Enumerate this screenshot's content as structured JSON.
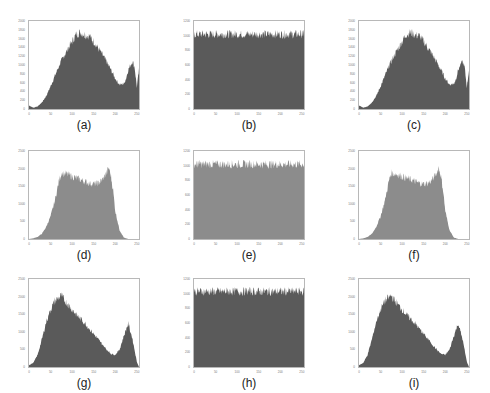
{
  "chart_data": [
    {
      "id": "a",
      "caption": "(a)",
      "type": "bar",
      "fill": "#5a5a5a",
      "xlim": [
        0,
        255
      ],
      "ylim": [
        0,
        2000
      ],
      "xticks": [
        0,
        50,
        100,
        150,
        200,
        250
      ],
      "yticks": [
        0,
        200,
        400,
        600,
        800,
        1000,
        1200,
        1400,
        1600,
        1800,
        2000
      ],
      "shape": "bimodal",
      "x": [
        0,
        10,
        20,
        30,
        40,
        50,
        60,
        70,
        80,
        90,
        100,
        110,
        120,
        130,
        140,
        150,
        160,
        170,
        180,
        190,
        200,
        210,
        220,
        225,
        230,
        240,
        245,
        250,
        255
      ],
      "values": [
        80,
        30,
        60,
        150,
        300,
        520,
        760,
        1000,
        1200,
        1380,
        1550,
        1720,
        1760,
        1700,
        1680,
        1550,
        1400,
        1250,
        1080,
        900,
        700,
        560,
        580,
        700,
        900,
        1100,
        950,
        500,
        900
      ]
    },
    {
      "id": "b",
      "caption": "(b)",
      "type": "bar",
      "fill": "#5a5a5a",
      "xlim": [
        0,
        255
      ],
      "ylim": [
        0,
        1200
      ],
      "xticks": [
        0,
        50,
        100,
        150,
        200,
        250
      ],
      "yticks": [
        0,
        200,
        400,
        600,
        800,
        1000,
        1200
      ],
      "shape": "uniform",
      "mean": 1020,
      "noise": 60
    },
    {
      "id": "c",
      "caption": "(c)",
      "type": "bar",
      "fill": "#5a5a5a",
      "xlim": [
        0,
        255
      ],
      "ylim": [
        0,
        2000
      ],
      "xticks": [
        0,
        50,
        100,
        150,
        200,
        250
      ],
      "yticks": [
        0,
        200,
        400,
        600,
        800,
        1000,
        1200,
        1400,
        1600,
        1800,
        2000
      ],
      "shape": "bimodal",
      "x": [
        0,
        10,
        20,
        30,
        40,
        50,
        60,
        70,
        80,
        90,
        100,
        110,
        120,
        130,
        140,
        150,
        160,
        170,
        180,
        190,
        200,
        210,
        220,
        225,
        230,
        240,
        245,
        250,
        255
      ],
      "values": [
        80,
        30,
        60,
        150,
        300,
        520,
        760,
        1000,
        1200,
        1380,
        1550,
        1720,
        1760,
        1700,
        1680,
        1550,
        1400,
        1250,
        1080,
        900,
        700,
        560,
        580,
        700,
        900,
        1100,
        950,
        500,
        900
      ]
    },
    {
      "id": "d",
      "caption": "(d)",
      "type": "bar",
      "fill": "#8c8c8c",
      "xlim": [
        0,
        255
      ],
      "ylim": [
        0,
        2500
      ],
      "xticks": [
        0,
        50,
        100,
        150,
        200,
        250
      ],
      "yticks": [
        0,
        500,
        1000,
        1500,
        2000,
        2500
      ],
      "shape": "plateau",
      "x": [
        0,
        10,
        20,
        30,
        40,
        50,
        60,
        70,
        75,
        80,
        90,
        100,
        110,
        120,
        130,
        140,
        150,
        160,
        170,
        180,
        185,
        190,
        195,
        200,
        210,
        220,
        230,
        255
      ],
      "values": [
        0,
        20,
        60,
        150,
        350,
        650,
        1100,
        1700,
        1900,
        1880,
        1850,
        1800,
        1750,
        1700,
        1650,
        1600,
        1580,
        1600,
        1700,
        1900,
        2050,
        1800,
        1400,
        800,
        250,
        40,
        0,
        0
      ]
    },
    {
      "id": "e",
      "caption": "(e)",
      "type": "bar",
      "fill": "#8c8c8c",
      "xlim": [
        0,
        255
      ],
      "ylim": [
        0,
        1200
      ],
      "xticks": [
        0,
        50,
        100,
        150,
        200,
        250
      ],
      "yticks": [
        0,
        200,
        400,
        600,
        800,
        1000,
        1200
      ],
      "shape": "uniform",
      "mean": 1020,
      "noise": 60
    },
    {
      "id": "f",
      "caption": "(f)",
      "type": "bar",
      "fill": "#8c8c8c",
      "xlim": [
        0,
        255
      ],
      "ylim": [
        0,
        2500
      ],
      "xticks": [
        0,
        50,
        100,
        150,
        200,
        250
      ],
      "yticks": [
        0,
        500,
        1000,
        1500,
        2000,
        2500
      ],
      "shape": "plateau",
      "x": [
        0,
        10,
        20,
        30,
        40,
        50,
        60,
        70,
        75,
        80,
        90,
        100,
        110,
        120,
        130,
        140,
        150,
        160,
        170,
        180,
        185,
        190,
        195,
        200,
        210,
        220,
        230,
        255
      ],
      "values": [
        0,
        20,
        60,
        150,
        350,
        650,
        1100,
        1700,
        1900,
        1880,
        1850,
        1800,
        1750,
        1700,
        1650,
        1600,
        1580,
        1600,
        1700,
        1900,
        2050,
        1800,
        1400,
        800,
        250,
        40,
        0,
        0
      ]
    },
    {
      "id": "g",
      "caption": "(g)",
      "type": "bar",
      "fill": "#5a5a5a",
      "xlim": [
        0,
        255
      ],
      "ylim": [
        0,
        2500
      ],
      "xticks": [
        0,
        50,
        100,
        150,
        200,
        250
      ],
      "yticks": [
        0,
        500,
        1000,
        1500,
        2000,
        2500
      ],
      "shape": "bimodal",
      "x": [
        0,
        10,
        20,
        30,
        40,
        50,
        60,
        70,
        75,
        80,
        90,
        100,
        110,
        120,
        130,
        140,
        150,
        160,
        170,
        180,
        190,
        200,
        210,
        220,
        230,
        240,
        250,
        255
      ],
      "values": [
        50,
        120,
        350,
        800,
        1300,
        1650,
        1900,
        2000,
        2050,
        1950,
        1800,
        1650,
        1500,
        1380,
        1250,
        1100,
        950,
        800,
        650,
        500,
        380,
        350,
        500,
        900,
        1250,
        800,
        150,
        0
      ]
    },
    {
      "id": "h",
      "caption": "(h)",
      "type": "bar",
      "fill": "#5a5a5a",
      "xlim": [
        0,
        255
      ],
      "ylim": [
        0,
        1200
      ],
      "xticks": [
        0,
        50,
        100,
        150,
        200,
        250
      ],
      "yticks": [
        0,
        200,
        400,
        600,
        800,
        1000,
        1200
      ],
      "shape": "uniform",
      "mean": 1030,
      "noise": 60
    },
    {
      "id": "i",
      "caption": "(i)",
      "type": "bar",
      "fill": "#5a5a5a",
      "xlim": [
        0,
        255
      ],
      "ylim": [
        0,
        2500
      ],
      "xticks": [
        0,
        50,
        100,
        150,
        200,
        250
      ],
      "yticks": [
        0,
        500,
        1000,
        1500,
        2000,
        2500
      ],
      "shape": "bimodal",
      "x": [
        0,
        10,
        20,
        30,
        40,
        50,
        60,
        70,
        75,
        80,
        90,
        100,
        110,
        120,
        130,
        140,
        150,
        160,
        170,
        180,
        190,
        200,
        210,
        220,
        230,
        240,
        250,
        255
      ],
      "values": [
        50,
        120,
        350,
        800,
        1300,
        1650,
        1900,
        2000,
        2050,
        1950,
        1800,
        1650,
        1500,
        1380,
        1250,
        1100,
        950,
        800,
        650,
        500,
        380,
        350,
        500,
        900,
        1250,
        800,
        150,
        0
      ]
    }
  ],
  "captions": [
    "(a)",
    "(b)",
    "(c)",
    "(d)",
    "(e)",
    "(f)",
    "(g)",
    "(h)",
    "(i)"
  ]
}
